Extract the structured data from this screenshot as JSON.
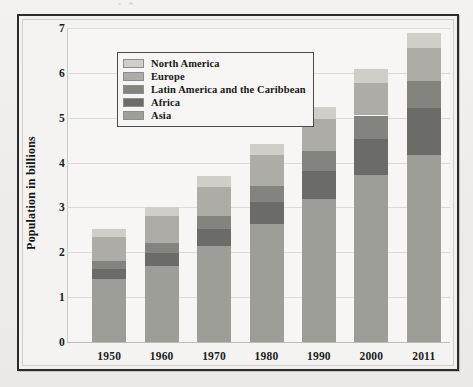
{
  "chart_data": {
    "type": "bar",
    "subtype": "stacked-vertical",
    "title": "",
    "xlabel": "",
    "ylabel": "Population in billions",
    "categories": [
      "1950",
      "1960",
      "1970",
      "1980",
      "1990",
      "2000",
      "2011"
    ],
    "ylim": [
      0,
      7
    ],
    "yticks": [
      "0",
      "1",
      "2",
      "3",
      "4",
      "5",
      "6",
      "7"
    ],
    "grid": true,
    "legend_position": "top-left inside plot",
    "stack_order_bottom_to_top": [
      "Asia",
      "Africa",
      "Latin America and the Caribbean",
      "Europe",
      "North America"
    ],
    "series": [
      {
        "name": "Asia",
        "color": "#9e9e99",
        "values": [
          1.4,
          1.7,
          2.14,
          2.64,
          3.18,
          3.72,
          4.18
        ]
      },
      {
        "name": "Africa",
        "color": "#6b6b68",
        "values": [
          0.23,
          0.28,
          0.37,
          0.48,
          0.63,
          0.81,
          1.03
        ]
      },
      {
        "name": "Latin America and the Caribbean",
        "color": "#84847f",
        "values": [
          0.17,
          0.22,
          0.29,
          0.36,
          0.44,
          0.52,
          0.6
        ]
      },
      {
        "name": "Europe",
        "color": "#adaca7",
        "values": [
          0.55,
          0.6,
          0.66,
          0.69,
          0.72,
          0.73,
          0.74
        ]
      },
      {
        "name": "North America",
        "color": "#cfcec9",
        "values": [
          0.17,
          0.2,
          0.23,
          0.25,
          0.28,
          0.31,
          0.35
        ]
      }
    ],
    "totals": [
      2.52,
      3.0,
      3.69,
      4.42,
      5.25,
      6.09,
      6.9
    ]
  },
  "legend": {
    "items": [
      {
        "label": "North America",
        "color": "#cfcec9"
      },
      {
        "label": "Europe",
        "color": "#adaca7"
      },
      {
        "label": "Latin America and the Caribbean",
        "color": "#84847f"
      },
      {
        "label": "Africa",
        "color": "#6b6b68"
      },
      {
        "label": "Asia",
        "color": "#9e9e99"
      }
    ]
  },
  "colors": {
    "page_background": "#efefed",
    "figure_background": "#f4f3f1",
    "frame_border": "#2b2b2b",
    "gridline": "#dcdbd8",
    "axis_text": "#1b1b1b"
  }
}
